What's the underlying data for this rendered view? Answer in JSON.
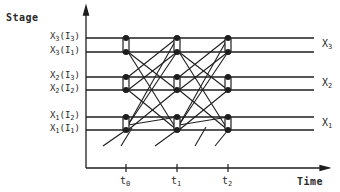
{
  "diagram": {
    "y_axis_title": "Stage",
    "x_axis_title": "Time",
    "stage_lines": [
      {
        "id": "x3_i3",
        "var": "X",
        "var_sub": "3",
        "arg": "I",
        "arg_sub": "3",
        "y": 38
      },
      {
        "id": "x3_i1",
        "var": "X",
        "var_sub": "3",
        "arg": "I",
        "arg_sub": "1",
        "y": 52
      },
      {
        "id": "x2_i3",
        "var": "X",
        "var_sub": "2",
        "arg": "I",
        "arg_sub": "3",
        "y": 77
      },
      {
        "id": "x2_i2",
        "var": "X",
        "var_sub": "2",
        "arg": "I",
        "arg_sub": "2",
        "y": 90
      },
      {
        "id": "x1_i2",
        "var": "X",
        "var_sub": "1",
        "arg": "I",
        "arg_sub": "2",
        "y": 117
      },
      {
        "id": "x1_i1",
        "var": "X",
        "var_sub": "1",
        "arg": "I",
        "arg_sub": "1",
        "y": 130
      }
    ],
    "stage_groups": [
      {
        "label": "X",
        "sub": "3",
        "y": 45
      },
      {
        "label": "X",
        "sub": "2",
        "y": 84
      },
      {
        "label": "X",
        "sub": "1",
        "y": 124
      }
    ],
    "time_ticks": [
      {
        "label": "t",
        "sub": "0",
        "x": 126
      },
      {
        "label": "t",
        "sub": "1",
        "x": 177
      },
      {
        "label": "t",
        "sub": "2",
        "x": 228
      }
    ],
    "colors": {
      "line": "#1e1e1e",
      "text": "#2a2a2a"
    }
  }
}
